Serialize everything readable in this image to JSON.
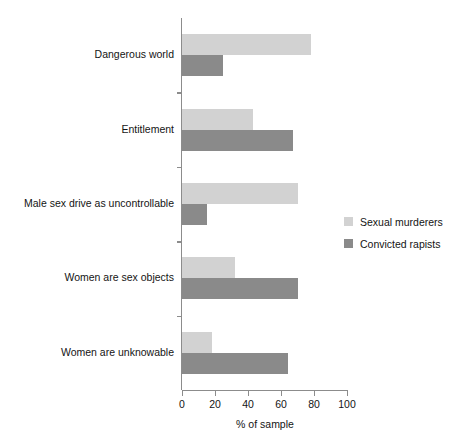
{
  "chart_data": {
    "type": "bar",
    "orientation": "horizontal",
    "title": "",
    "xlabel": "% of sample",
    "ylabel": "",
    "xlim": [
      0,
      100
    ],
    "xticks": [
      0,
      20,
      40,
      60,
      80,
      100
    ],
    "grid": false,
    "legend_position": "right",
    "categories": [
      "Dangerous world",
      "Entitlement",
      "Male sex drive as uncontrollable",
      "Women are sex objects",
      "Women are unknowable"
    ],
    "series": [
      {
        "name": "Sexual murderers",
        "color": "#d2d2d2",
        "values": [
          78,
          43,
          70,
          32,
          18
        ]
      },
      {
        "name": "Convicted rapists",
        "color": "#8a8a8a",
        "values": [
          25,
          67,
          15,
          70,
          64
        ]
      }
    ]
  }
}
